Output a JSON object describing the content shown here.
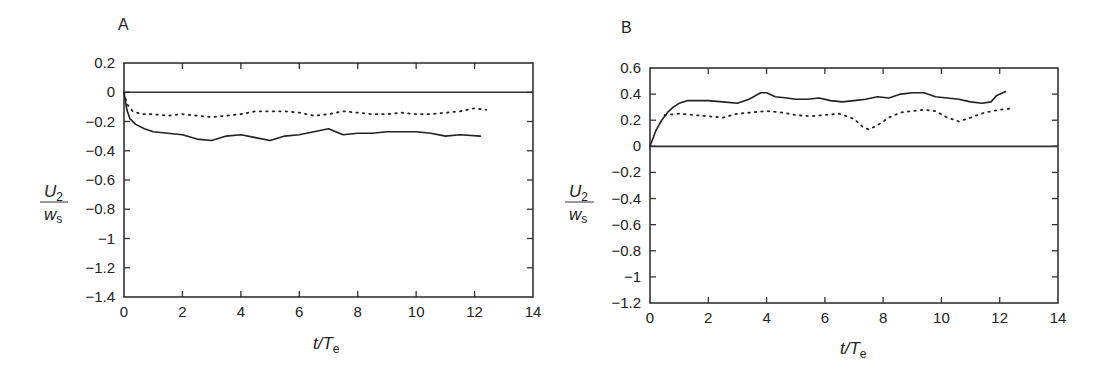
{
  "chart_data": [
    {
      "panel": "A",
      "type": "line",
      "title": "",
      "xlabel": "t/T_e",
      "ylabel": "U_2 / w_s",
      "xlim": [
        0,
        14
      ],
      "ylim": [
        -1.4,
        0.2
      ],
      "xticks": [
        0,
        2,
        4,
        6,
        8,
        10,
        12,
        14
      ],
      "yticks": [
        0.2,
        0,
        -0.2,
        -0.4,
        -0.6,
        -0.8,
        -1,
        -1.2,
        -1.4
      ],
      "ytick_labels": [
        "0.2",
        "0",
        "−0.2",
        "−0.4",
        "−0.6",
        "−0.8",
        "−1",
        "−1.2",
        "−1.4"
      ],
      "grid": false,
      "legend": null,
      "reference_line": 0,
      "series": [
        {
          "name": "solid",
          "style": "solid",
          "x": [
            0,
            0.1,
            0.2,
            0.4,
            0.7,
            1.0,
            1.5,
            2.0,
            2.5,
            3.0,
            3.5,
            4.0,
            4.5,
            5.0,
            5.5,
            6.0,
            6.5,
            7.0,
            7.5,
            8.0,
            8.5,
            9.0,
            9.5,
            10.0,
            10.5,
            11.0,
            11.5,
            12.2
          ],
          "y": [
            0,
            -0.12,
            -0.18,
            -0.22,
            -0.25,
            -0.27,
            -0.28,
            -0.29,
            -0.32,
            -0.33,
            -0.3,
            -0.29,
            -0.31,
            -0.33,
            -0.3,
            -0.29,
            -0.27,
            -0.25,
            -0.29,
            -0.28,
            -0.28,
            -0.27,
            -0.27,
            -0.27,
            -0.28,
            -0.3,
            -0.29,
            -0.3
          ]
        },
        {
          "name": "dotted",
          "style": "dotted",
          "x": [
            0,
            0.1,
            0.3,
            0.6,
            1.0,
            1.5,
            2.0,
            2.5,
            3.0,
            3.5,
            4.0,
            4.5,
            5.0,
            5.5,
            6.0,
            6.5,
            7.0,
            7.5,
            8.0,
            8.5,
            9.0,
            9.5,
            10.0,
            10.5,
            11.0,
            11.5,
            12.0,
            12.4
          ],
          "y": [
            0,
            -0.08,
            -0.13,
            -0.15,
            -0.15,
            -0.16,
            -0.15,
            -0.16,
            -0.17,
            -0.16,
            -0.15,
            -0.13,
            -0.13,
            -0.13,
            -0.14,
            -0.16,
            -0.15,
            -0.13,
            -0.14,
            -0.15,
            -0.15,
            -0.14,
            -0.15,
            -0.15,
            -0.14,
            -0.13,
            -0.11,
            -0.12
          ]
        }
      ]
    },
    {
      "panel": "B",
      "type": "line",
      "title": "",
      "xlabel": "t/T_e",
      "ylabel": "U_2 / w_s",
      "xlim": [
        0,
        14
      ],
      "ylim": [
        -1.2,
        0.6
      ],
      "xticks": [
        0,
        2,
        4,
        6,
        8,
        10,
        12,
        14
      ],
      "yticks": [
        0.6,
        0.4,
        0.2,
        0,
        -0.2,
        -0.4,
        -0.6,
        -0.8,
        -1,
        -1.2
      ],
      "ytick_labels": [
        "0.6",
        "0.4",
        "0.2",
        "0",
        "−0.2",
        "−0.4",
        "−0.6",
        "−0.8",
        "−1",
        "−1.2"
      ],
      "grid": false,
      "legend": null,
      "reference_line": 0,
      "series": [
        {
          "name": "solid",
          "style": "solid",
          "x": [
            0,
            0.2,
            0.4,
            0.6,
            0.8,
            1.0,
            1.3,
            1.6,
            2.0,
            2.5,
            3.0,
            3.4,
            3.8,
            4.0,
            4.3,
            4.7,
            5.0,
            5.4,
            5.8,
            6.2,
            6.6,
            7.0,
            7.4,
            7.8,
            8.2,
            8.6,
            9.0,
            9.4,
            9.8,
            10.2,
            10.6,
            11.0,
            11.4,
            11.7,
            11.9,
            12.2
          ],
          "y": [
            0,
            0.12,
            0.2,
            0.26,
            0.3,
            0.33,
            0.35,
            0.35,
            0.35,
            0.34,
            0.33,
            0.36,
            0.41,
            0.41,
            0.38,
            0.37,
            0.36,
            0.36,
            0.37,
            0.35,
            0.34,
            0.35,
            0.36,
            0.38,
            0.37,
            0.4,
            0.41,
            0.41,
            0.38,
            0.37,
            0.36,
            0.34,
            0.33,
            0.34,
            0.39,
            0.42
          ]
        },
        {
          "name": "dotted",
          "style": "dotted",
          "x": [
            0.5,
            1.0,
            1.5,
            2.0,
            2.5,
            3.0,
            3.5,
            4.0,
            4.5,
            5.0,
            5.5,
            6.0,
            6.5,
            7.0,
            7.3,
            7.5,
            7.8,
            8.2,
            8.6,
            9.0,
            9.4,
            9.8,
            10.2,
            10.6,
            11.0,
            11.5,
            12.0,
            12.4
          ],
          "y": [
            0.24,
            0.25,
            0.24,
            0.23,
            0.22,
            0.25,
            0.26,
            0.27,
            0.26,
            0.24,
            0.23,
            0.24,
            0.25,
            0.21,
            0.15,
            0.13,
            0.16,
            0.22,
            0.26,
            0.27,
            0.28,
            0.27,
            0.22,
            0.19,
            0.22,
            0.26,
            0.28,
            0.29
          ]
        }
      ]
    }
  ],
  "panels": {
    "a": {
      "label": "A",
      "xlabel_main": "t/T",
      "xlabel_sub": "e",
      "ylabel_num": "U",
      "ylabel_num_sub": "2",
      "ylabel_den": "w",
      "ylabel_den_sub": "s"
    },
    "b": {
      "label": "B",
      "xlabel_main": "t/T",
      "xlabel_sub": "e",
      "ylabel_num": "U",
      "ylabel_num_sub": "2",
      "ylabel_den": "w",
      "ylabel_den_sub": "s"
    }
  },
  "colors": {
    "line": "#222222",
    "axis": "#333333",
    "background": "#ffffff"
  }
}
